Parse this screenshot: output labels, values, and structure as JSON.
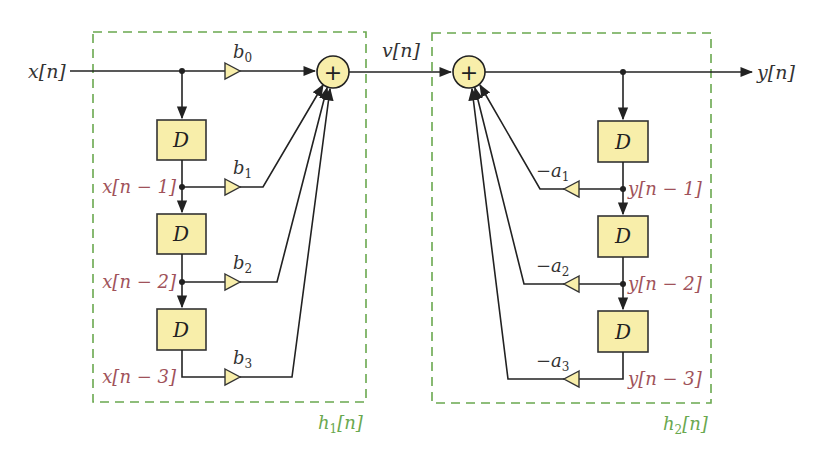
{
  "diagram": {
    "type": "signal-flow block diagram (direct form I IIR filter)",
    "signals": {
      "input": "x[n]",
      "intermediate": "v[n]",
      "output": "y[n]"
    },
    "fir_section": {
      "label": "h₁[n]",
      "label_main": "h",
      "label_sub": "1",
      "label_tail": "[n]",
      "delay_label": "D",
      "taps": [
        "x[n − 1]",
        "x[n − 2]",
        "x[n − 3]"
      ],
      "coefficients": [
        {
          "base": "b",
          "sub": "0"
        },
        {
          "base": "b",
          "sub": "1"
        },
        {
          "base": "b",
          "sub": "2"
        },
        {
          "base": "b",
          "sub": "3"
        }
      ]
    },
    "iir_section": {
      "label": "h₂[n]",
      "label_main": "h",
      "label_sub": "2",
      "label_tail": "[n]",
      "delay_label": "D",
      "taps": [
        "y[n − 1]",
        "y[n − 2]",
        "y[n − 3]"
      ],
      "coefficients": [
        {
          "base": "−a",
          "sub": "1"
        },
        {
          "base": "−a",
          "sub": "2"
        },
        {
          "base": "−a",
          "sub": "3"
        }
      ]
    },
    "adder_symbol": "+",
    "colors": {
      "block_fill": "#f8eeaa",
      "tap_label": "#a0525a",
      "section_border": "#6aa84f",
      "wire": "#222222"
    }
  }
}
